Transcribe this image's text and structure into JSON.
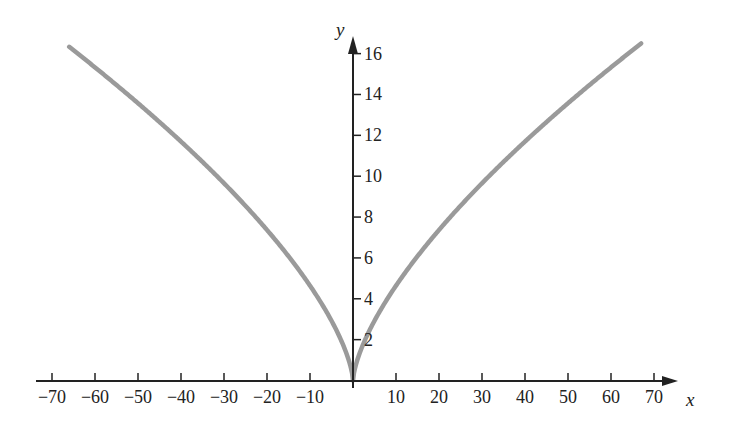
{
  "chart_data": {
    "type": "line",
    "title": "",
    "xlabel": "x",
    "ylabel": "y",
    "function": "y = x^(2/3)",
    "xlim": [
      -72,
      78
    ],
    "ylim": [
      0,
      17.5
    ],
    "grid": false,
    "legend": null,
    "x_ticks": [
      -70,
      -60,
      -50,
      -40,
      -30,
      -20,
      -10,
      10,
      20,
      30,
      40,
      50,
      60,
      70
    ],
    "y_ticks": [
      2,
      4,
      6,
      8,
      10,
      12,
      14,
      16
    ],
    "x_tick_labels": [
      "−70",
      "−60",
      "−50",
      "−40",
      "−30",
      "−20",
      "−10",
      "10",
      "20",
      "30",
      "40",
      "50",
      "60",
      "70"
    ],
    "y_tick_labels": [
      "2",
      "4",
      "6",
      "8",
      "10",
      "12",
      "14",
      "16"
    ],
    "series": [
      {
        "name": "y = x^(2/3)",
        "color": "#9a9a9a",
        "x": [
          -66,
          -60,
          -50,
          -40,
          -30,
          -20,
          -10,
          -5,
          -1,
          0,
          1,
          5,
          10,
          20,
          30,
          40,
          50,
          60,
          67
        ],
        "y": [
          16.33,
          15.33,
          13.57,
          11.7,
          9.65,
          7.37,
          4.64,
          2.92,
          1.0,
          0,
          1.0,
          2.92,
          4.64,
          7.37,
          9.65,
          11.7,
          13.57,
          15.33,
          16.49
        ]
      }
    ]
  },
  "axes": {
    "x_name": "x",
    "y_name": "y",
    "axis_color": "#222222",
    "curve_color": "#9a9a9a"
  }
}
